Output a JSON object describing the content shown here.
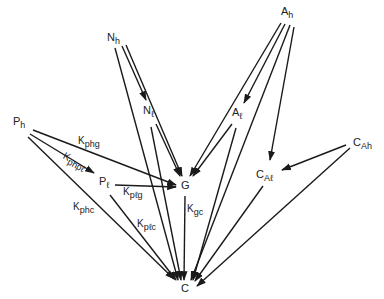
{
  "nodes": {
    "Nh": {
      "main": "N",
      "sub": "h"
    },
    "Nl": {
      "main": "N",
      "sub": "ℓ"
    },
    "Ah": {
      "main": "A",
      "sub": "h"
    },
    "Al": {
      "main": "A",
      "sub": "ℓ"
    },
    "Ph": {
      "main": "P",
      "sub": "h"
    },
    "Pl": {
      "main": "P",
      "sub": "ℓ"
    },
    "G": {
      "main": "G",
      "sub": ""
    },
    "C": {
      "main": "C",
      "sub": ""
    },
    "CAh": {
      "main": "C",
      "sub": "Ah"
    },
    "CAl": {
      "main": "C",
      "sub": "Aℓ"
    }
  },
  "rate_labels": {
    "Kphg": {
      "main": "K",
      "sub": "phg"
    },
    "Kphpl": {
      "main": "K",
      "sub": "phpℓ"
    },
    "Kplg": {
      "main": "K",
      "sub": "pℓg"
    },
    "Kphc": {
      "main": "K",
      "sub": "phc"
    },
    "Kplc": {
      "main": "K",
      "sub": "pℓc"
    },
    "Kgc": {
      "main": "K",
      "sub": "gc"
    }
  },
  "edges": [
    {
      "from": "Nh",
      "to": "Nl"
    },
    {
      "from": "Nh",
      "to": "G"
    },
    {
      "from": "Nh",
      "to": "C"
    },
    {
      "from": "Nl",
      "to": "G"
    },
    {
      "from": "Nl",
      "to": "C"
    },
    {
      "from": "Ah",
      "to": "Al"
    },
    {
      "from": "Ah",
      "to": "G"
    },
    {
      "from": "Ah",
      "to": "C"
    },
    {
      "from": "Ah",
      "to": "CAl"
    },
    {
      "from": "Al",
      "to": "G"
    },
    {
      "from": "Al",
      "to": "C"
    },
    {
      "from": "Ph",
      "to": "G",
      "label": "Kphg"
    },
    {
      "from": "Ph",
      "to": "Pl",
      "label": "Kphpl"
    },
    {
      "from": "Ph",
      "to": "C",
      "label": "Kphc"
    },
    {
      "from": "Pl",
      "to": "G",
      "label": "Kplg"
    },
    {
      "from": "Pl",
      "to": "C",
      "label": "Kplc"
    },
    {
      "from": "G",
      "to": "C",
      "label": "Kgc"
    },
    {
      "from": "CAh",
      "to": "CAl"
    },
    {
      "from": "CAh",
      "to": "C"
    },
    {
      "from": "CAl",
      "to": "C"
    }
  ]
}
